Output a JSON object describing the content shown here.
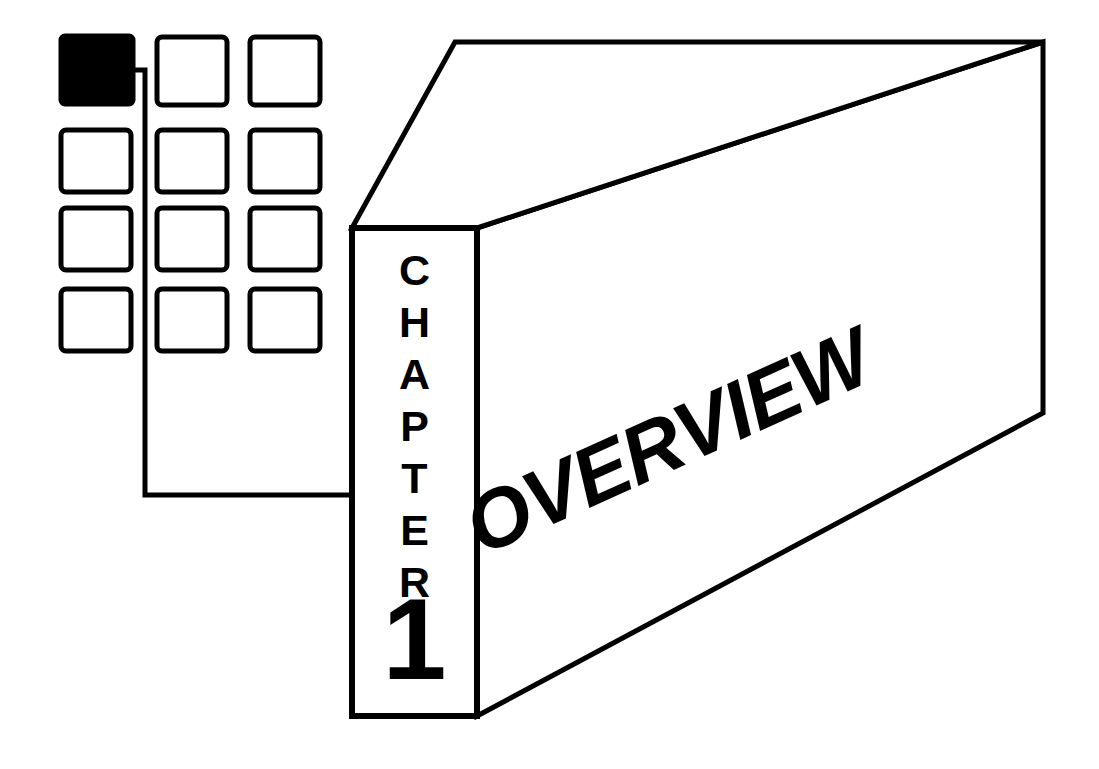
{
  "page": {
    "background_color": "#ffffff",
    "ink_color": "#000000",
    "width": 1099,
    "height": 769,
    "kind": "book-chapter-opener-illustration"
  },
  "chapter_tab": {
    "word": "CHAPTER",
    "letters": [
      "C",
      "H",
      "A",
      "P",
      "T",
      "E",
      "R"
    ],
    "number": "1",
    "orientation": "vertical-stacked"
  },
  "chapter_title": {
    "text": "OVERVIEW",
    "rotation_degrees": -24.2
  },
  "grid": {
    "rows": 4,
    "columns": 3,
    "highlighted_cell": {
      "row": 1,
      "column": 1
    },
    "cells": [
      {
        "id": "cell-r1c1",
        "row": 1,
        "column": 1,
        "filled": true,
        "x": 61,
        "y": 36,
        "w": 72,
        "h": 68
      },
      {
        "id": "cell-r1c2",
        "row": 1,
        "column": 2,
        "filled": false,
        "x": 157,
        "y": 37,
        "w": 70,
        "h": 68
      },
      {
        "id": "cell-r1c3",
        "row": 1,
        "column": 3,
        "filled": false,
        "x": 250,
        "y": 37,
        "w": 70,
        "h": 68
      },
      {
        "id": "cell-r2c1",
        "row": 2,
        "column": 1,
        "filled": false,
        "x": 61,
        "y": 130,
        "w": 70,
        "h": 62
      },
      {
        "id": "cell-r2c2",
        "row": 2,
        "column": 2,
        "filled": false,
        "x": 157,
        "y": 130,
        "w": 70,
        "h": 62
      },
      {
        "id": "cell-r2c3",
        "row": 2,
        "column": 3,
        "filled": false,
        "x": 250,
        "y": 130,
        "w": 70,
        "h": 62
      },
      {
        "id": "cell-r3c1",
        "row": 3,
        "column": 1,
        "filled": false,
        "x": 61,
        "y": 208,
        "w": 70,
        "h": 62
      },
      {
        "id": "cell-r3c2",
        "row": 3,
        "column": 2,
        "filled": false,
        "x": 157,
        "y": 208,
        "w": 70,
        "h": 62
      },
      {
        "id": "cell-r3c3",
        "row": 3,
        "column": 3,
        "filled": false,
        "x": 250,
        "y": 208,
        "w": 70,
        "h": 62
      },
      {
        "id": "cell-r4c1",
        "row": 4,
        "column": 1,
        "filled": false,
        "x": 61,
        "y": 289,
        "w": 70,
        "h": 62
      },
      {
        "id": "cell-r4c2",
        "row": 4,
        "column": 2,
        "filled": false,
        "x": 157,
        "y": 289,
        "w": 70,
        "h": 62
      },
      {
        "id": "cell-r4c3",
        "row": 4,
        "column": 3,
        "filled": false,
        "x": 250,
        "y": 289,
        "w": 70,
        "h": 62
      }
    ]
  },
  "connector": {
    "description": "elbow line from highlighted grid cell to chapter tab",
    "path": "M133,70 L145,70 L145,495 L350,495"
  },
  "slab": {
    "front_face": "M352,228 L477,228 L477,716 L352,716 Z",
    "top_face": "M352,228 L455,42 L1043,42 L477,228 Z",
    "side_face": "M477,228 L1043,42 L1043,413 L477,716 Z"
  }
}
